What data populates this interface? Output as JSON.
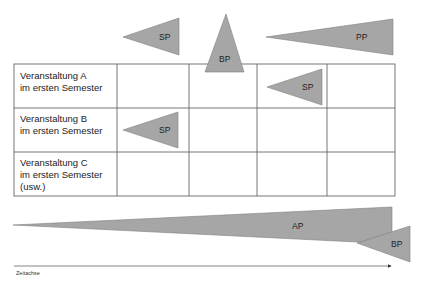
{
  "diagram": {
    "colors": {
      "shape_fill": "#a6a6a6",
      "shape_stroke": "#7f7f7f",
      "grid_line": "#555555",
      "text": "#222222"
    },
    "top_shapes": [
      {
        "id": "sp-top",
        "label": "SP",
        "type": "left-pointing-triangle"
      },
      {
        "id": "bp-top",
        "label": "BP",
        "type": "upward-triangle"
      },
      {
        "id": "pp-top",
        "label": "PP",
        "type": "left-pointing-triangle"
      }
    ],
    "table": {
      "rows": [
        {
          "label_line1": "Veranstaltung A",
          "label_line2": "im ersten Semester",
          "label_line3": "",
          "marker": {
            "label": "SP",
            "column": 3
          }
        },
        {
          "label_line1": "Veranstaltung B",
          "label_line2": "im ersten Semester",
          "label_line3": "",
          "marker": {
            "label": "SP",
            "column": 1
          }
        },
        {
          "label_line1": "Veranstaltung C",
          "label_line2": "im ersten Semester",
          "label_line3": "(usw.)",
          "marker": null
        }
      ],
      "columns": 5
    },
    "bottom_shapes": [
      {
        "id": "ap-bottom",
        "label": "AP",
        "type": "left-pointing-wedge"
      },
      {
        "id": "bp-bottom",
        "label": "BP",
        "type": "left-pointing-triangle"
      }
    ],
    "axis": {
      "label": "Zeitachse"
    }
  }
}
